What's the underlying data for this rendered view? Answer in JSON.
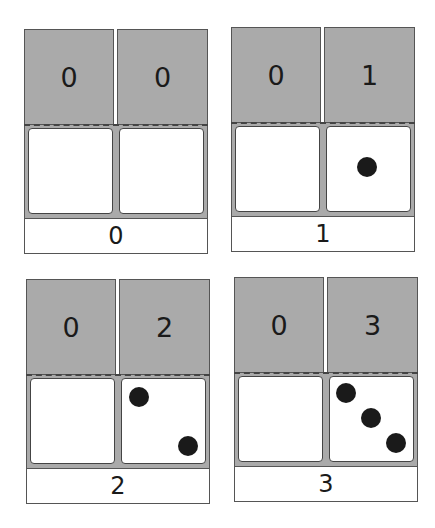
{
  "panels": [
    {
      "tens": "0",
      "ones": "0",
      "total": "0",
      "ones_dots": 0
    },
    {
      "tens": "0",
      "ones": "1",
      "total": "1",
      "ones_dots": 1
    },
    {
      "tens": "0",
      "ones": "2",
      "total": "2",
      "ones_dots": 2
    },
    {
      "tens": "0",
      "ones": "3",
      "total": "3",
      "ones_dots": 3
    }
  ],
  "colors": {
    "place_value_fill": "#aaaaaa",
    "dot": "#1a1a1a",
    "border": "#555555"
  }
}
